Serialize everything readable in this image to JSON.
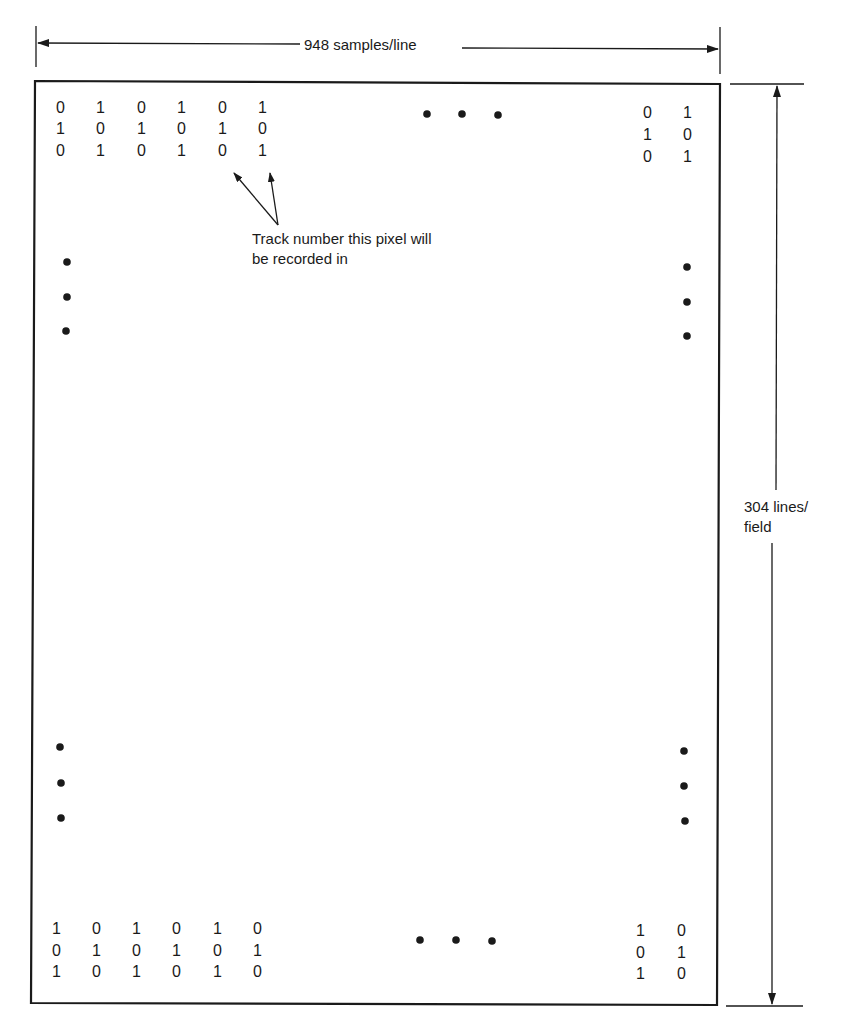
{
  "dimensions": {
    "width_label": "948 samples/line",
    "height_label_line1": "304 lines/",
    "height_label_line2": "field"
  },
  "annotation": {
    "line1": "Track number this pixel will",
    "line2": "be recorded in"
  },
  "grid": {
    "top_left": [
      [
        "0",
        "1",
        "0",
        "1",
        "0",
        "1"
      ],
      [
        "1",
        "0",
        "1",
        "0",
        "1",
        "0"
      ],
      [
        "0",
        "1",
        "0",
        "1",
        "0",
        "1"
      ]
    ],
    "top_right": [
      [
        "0",
        "1"
      ],
      [
        "1",
        "0"
      ],
      [
        "0",
        "1"
      ]
    ],
    "bottom_left": [
      [
        "1",
        "0",
        "1",
        "0",
        "1",
        "0"
      ],
      [
        "0",
        "1",
        "0",
        "1",
        "0",
        "1"
      ],
      [
        "1",
        "0",
        "1",
        "0",
        "1",
        "0"
      ]
    ],
    "bottom_right": [
      [
        "1",
        "0"
      ],
      [
        "0",
        "1"
      ],
      [
        "1",
        "0"
      ]
    ]
  },
  "colors": {
    "ink": "#1a1a1a",
    "background": "#ffffff"
  }
}
